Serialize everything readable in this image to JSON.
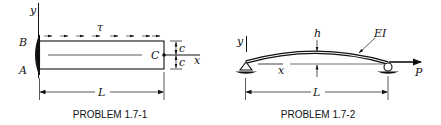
{
  "figures": [
    {
      "caption": "PROBLEM 1.7-1",
      "labels": {
        "y_axis": "y",
        "x_axis": "x",
        "shear_stress": "τ",
        "point_b": "B",
        "point_a": "A",
        "point_c": "C",
        "half_depth_top": "c",
        "half_depth_bottom": "c",
        "length": "L"
      }
    },
    {
      "caption": "PROBLEM 1.7-2",
      "labels": {
        "y_axis": "y",
        "x_axis": "x",
        "rise": "h",
        "flexural_rigidity": "EI",
        "load": "P",
        "length": "L"
      }
    }
  ],
  "colors": {
    "ink": "#111111",
    "background": "#ffffff"
  }
}
